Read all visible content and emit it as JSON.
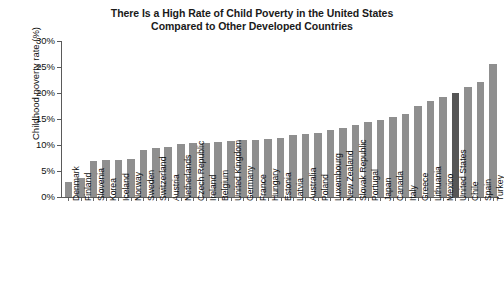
{
  "chart_data": {
    "type": "bar",
    "title": "There Is a High Rate of Child Poverty in the United States Compared to Other Developed Countries",
    "title_line1": "There Is a High Rate of Child Poverty in the United States",
    "title_line2": "Compared to Other Developed Countries",
    "xlabel": "",
    "ylabel": "Childhood poverty rate (%)",
    "ylim": [
      0,
      30
    ],
    "ytick_labels": [
      "0%",
      "5%",
      "10%",
      "15%",
      "20%",
      "25%",
      "30%"
    ],
    "ytick_values": [
      0,
      5,
      10,
      15,
      20,
      25,
      30
    ],
    "grid": false,
    "legend": "none",
    "bar_color": "#8f8f8f",
    "highlight_color": "#565656",
    "highlight_category": "United States",
    "categories": [
      "Denmark",
      "Finland",
      "Slovenia",
      "Korea",
      "Iceland",
      "Norway",
      "Sweden",
      "Switzerland",
      "Austria",
      "Netherlands",
      "Czech Republic",
      "Ireland",
      "Belgium",
      "United Kingdom",
      "Germany",
      "France",
      "Hungary",
      "Estonia",
      "Latvia",
      "Australia",
      "Poland",
      "Luxembourg",
      "New Zealand",
      "Slovak Republic",
      "Portugal",
      "Japan",
      "Canada",
      "Italy",
      "Greece",
      "Lithuania",
      "Mexico",
      "United States",
      "Chile",
      "Spain",
      "Turkey"
    ],
    "values": [
      2.9,
      3.6,
      7.0,
      7.1,
      7.1,
      7.3,
      9.1,
      9.5,
      9.6,
      10.2,
      10.3,
      10.4,
      10.6,
      10.7,
      10.9,
      11.0,
      11.1,
      11.3,
      11.9,
      12.2,
      12.4,
      12.9,
      13.3,
      13.8,
      14.4,
      14.9,
      15.4,
      16.0,
      17.5,
      18.5,
      19.2,
      20.0,
      21.1,
      22.2,
      25.5
    ]
  }
}
